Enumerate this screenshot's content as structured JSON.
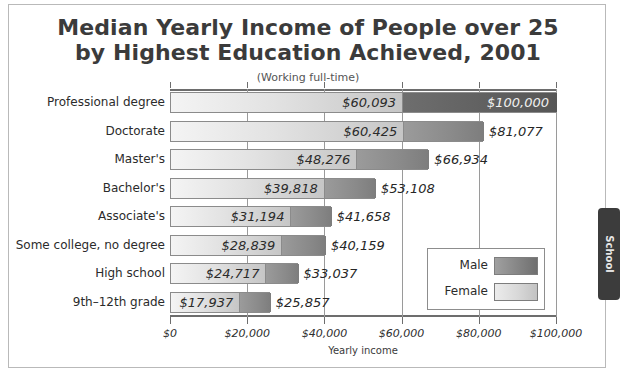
{
  "chart_data": {
    "type": "bar",
    "title": "Median Yearly Income of People over 25 by Highest Education Achieved, 2001",
    "title_line1": "Median Yearly Income of People over 25",
    "title_line2": "by Highest Education Achieved, 2001",
    "subtitle": "(Working full-time)",
    "xlabel": "Yearly income",
    "ylabel": "",
    "orientation": "horizontal",
    "xlim": [
      0,
      100000
    ],
    "grid": true,
    "legend_position": "inside-right",
    "xticks": [
      0,
      20000,
      40000,
      60000,
      80000,
      100000
    ],
    "xticklabels": [
      "$0",
      "$20,000",
      "$40,000",
      "$60,000",
      "$80,000",
      "$100,000"
    ],
    "categories": [
      "Professional degree",
      "Doctorate",
      "Master's",
      "Bachelor's",
      "Associate's",
      "Some college, no degree",
      "High school",
      "9th–12th grade"
    ],
    "series": [
      {
        "name": "Male",
        "color": "#7d7d7d",
        "values": [
          100000,
          81077,
          66934,
          53108,
          41658,
          40159,
          33037,
          25857
        ],
        "labels": [
          "$100,000",
          "$81,077",
          "$66,934",
          "$53,108",
          "$41,658",
          "$40,159",
          "$33,037",
          "$25,857"
        ]
      },
      {
        "name": "Female",
        "color": "#d2d2d2",
        "values": [
          60093,
          60425,
          48276,
          39818,
          31194,
          28839,
          24717,
          17937
        ],
        "labels": [
          "$60,093",
          "$60,425",
          "$48,276",
          "$39,818",
          "$31,194",
          "$28,839",
          "$24,717",
          "$17,937"
        ]
      }
    ]
  },
  "legend": {
    "male_label": "Male",
    "female_label": "Female"
  },
  "side_tab": {
    "label": "School"
  }
}
